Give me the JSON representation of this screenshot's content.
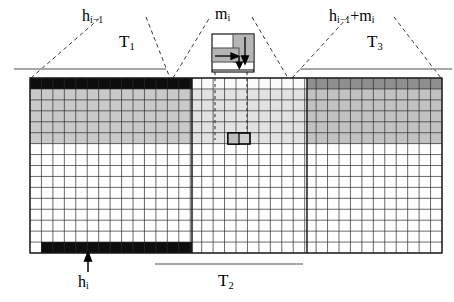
{
  "figure": {
    "title_labels": {
      "left_bracket": {
        "main": "h",
        "sub": "i−1",
        "tier": "T",
        "tier_sub": "1"
      },
      "middle_bracket": {
        "main": "m",
        "sub": "i"
      },
      "right_bracket": {
        "main": "h",
        "sub": "i−1",
        "extra": "+m",
        "extra_sub": "i",
        "tier": "T",
        "tier_sub": "3"
      },
      "bottom_arrow": {
        "main": "h",
        "sub": "i"
      },
      "bottom_bracket": {
        "tier": "T",
        "tier_sub": "2"
      }
    },
    "text": {
      "h_prev": "h",
      "h_prev_sub": "i−1",
      "T1": "T",
      "T1_sub": "1",
      "m": "m",
      "m_sub": "i",
      "h_plus_m": "h",
      "h_plus_m_sub": "i−1",
      "h_plus_m_tail": "+m",
      "h_plus_m_tail_sub": "i",
      "T3": "T",
      "T3_sub": "3",
      "h_i": "h",
      "h_i_sub": "i",
      "T2": "T",
      "T2_sub": "2"
    },
    "colors": {
      "black": "#000000",
      "dark_gray": "#808080",
      "mid_gray": "#a8a8a8",
      "light_gray": "#c9c9c9",
      "pale_gray": "#e2e2e2",
      "white": "#ffffff",
      "grid_line": "#2b2b2b",
      "rule_line": "#8a8a8a",
      "dashed_line": "#3a3a3a"
    },
    "grid": {
      "x": 30,
      "y": 78,
      "width": 412,
      "height": 175,
      "columns": 36,
      "rows": 16,
      "section_splits": [
        14,
        24
      ],
      "note": "three vertical regions T1 (cols 0-13), T2 (cols 14-23), T3 (cols 24-35)"
    },
    "grid_shading": {
      "left_section": {
        "top_row": "black",
        "band_rows": "light_gray",
        "band_end_row": 6,
        "bottom_row": "black"
      },
      "middle_section": {
        "top_row": "white",
        "band_rows": "pale_gray",
        "band_end_row": 6,
        "bottom_row": "white"
      },
      "right_section": {
        "top_row": "dark_gray",
        "band_rows": "light_gray",
        "band_end_row": 6,
        "bottom_row": "white"
      }
    },
    "highlight_cell": {
      "col": 17,
      "row": 5,
      "label": "highlighted-cell"
    },
    "inset": {
      "name": "m-i-detail-box",
      "x": 212,
      "y": 34,
      "width": 42,
      "height": 38,
      "tall_block": "gray",
      "wide_block": "gray",
      "arrows": [
        "down-arrow",
        "right-arrow",
        "diagonal-arrow"
      ]
    },
    "rules": {
      "left_rule": {
        "x1": 14,
        "x2": 166,
        "y": 69
      },
      "right_rule": {
        "x1": 300,
        "x2": 452,
        "y": 69
      },
      "bottom_rule": {
        "x1": 155,
        "x2": 303,
        "y": 264
      }
    }
  }
}
